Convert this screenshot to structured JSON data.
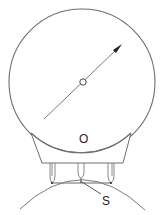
{
  "diagram": {
    "type": "spherometer-dial-gauge",
    "labels": {
      "dial_center": "O",
      "sagitta": "S"
    },
    "colors": {
      "stroke": "#6e6e6e",
      "text": "#222222",
      "background": "#ffffff"
    }
  }
}
